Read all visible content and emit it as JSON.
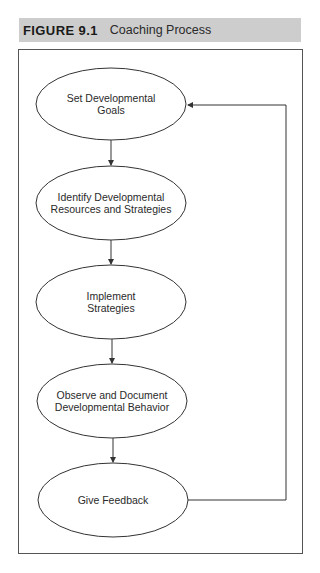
{
  "figure": {
    "number": "FIGURE 9.1",
    "title": "Coaching Process"
  },
  "nodes": [
    {
      "id": "goals",
      "label": "Set Developmental\nGoals"
    },
    {
      "id": "resources",
      "label": "Identify Developmental\nResources and Strategies"
    },
    {
      "id": "implement",
      "label": "Implement\nStrategies"
    },
    {
      "id": "observe",
      "label": "Observe and Document\nDevelopmental Behavior"
    },
    {
      "id": "feedback",
      "label": "Give Feedback"
    }
  ],
  "edges": [
    {
      "from": "goals",
      "to": "resources"
    },
    {
      "from": "resources",
      "to": "implement"
    },
    {
      "from": "implement",
      "to": "observe"
    },
    {
      "from": "observe",
      "to": "feedback"
    },
    {
      "from": "feedback",
      "to": "goals",
      "type": "loop-back"
    }
  ],
  "colors": {
    "header_bg": "#cdcdcd",
    "line": "#333333",
    "frame": "#555555"
  }
}
